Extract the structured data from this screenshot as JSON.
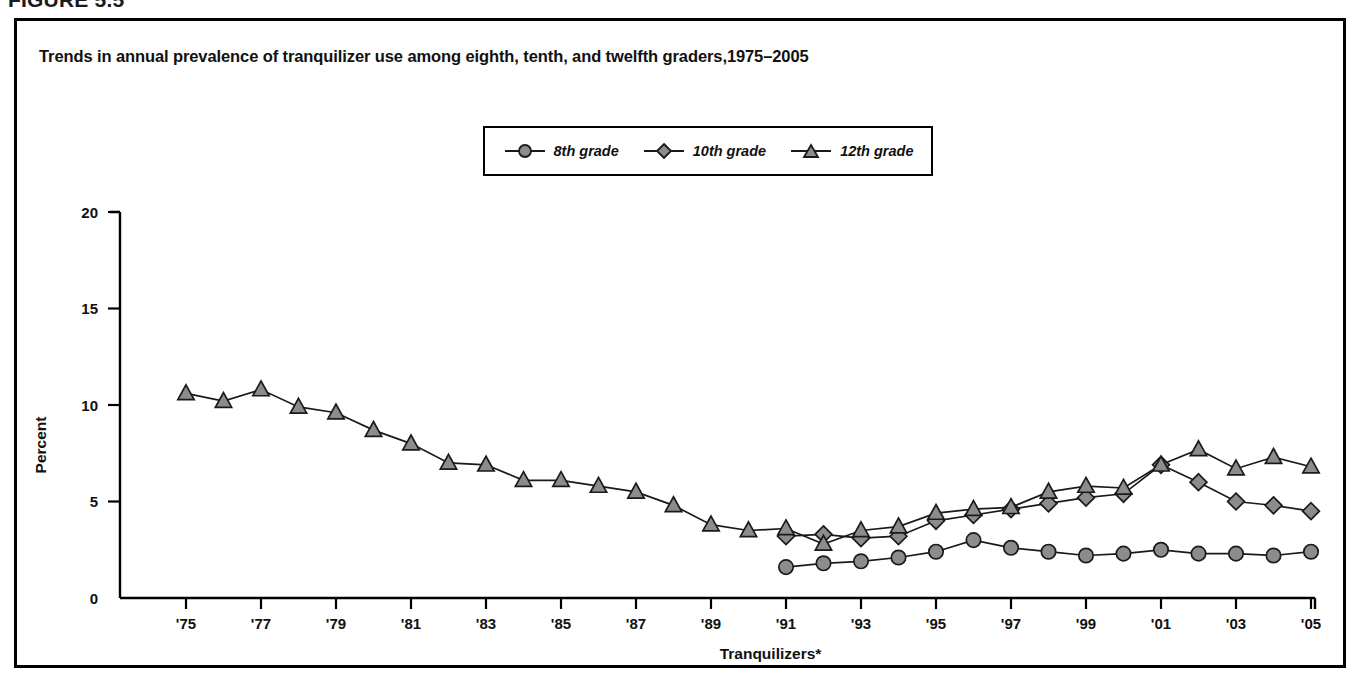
{
  "figure": {
    "number_label": "FIGURE 5.5",
    "title": "Trends in annual prevalence of tranquilizer use among eighth, tenth, and twelfth graders,1975–2005"
  },
  "legend": {
    "position": "top-center",
    "entries": [
      {
        "label": "8th grade",
        "marker": "circle",
        "marker_color": "#8c8c8c"
      },
      {
        "label": "10th grade",
        "marker": "diamond",
        "marker_color": "#8c8c8c"
      },
      {
        "label": "12th grade",
        "marker": "triangle",
        "marker_color": "#8c8c8c"
      }
    ]
  },
  "chart_data": {
    "type": "line",
    "title": "Trends in annual prevalence of tranquilizer use among eighth, tenth, and twelfth graders,1975–2005",
    "xlabel": "Tranquilizers*",
    "ylabel": "Percent",
    "ylim": [
      0,
      20
    ],
    "yticks": [
      0,
      5,
      10,
      15,
      20
    ],
    "ytick_labels": [
      "0",
      "5",
      "10",
      "15",
      "20"
    ],
    "xlim": [
      1975,
      2005
    ],
    "xticks": [
      1975,
      1977,
      1979,
      1981,
      1983,
      1985,
      1987,
      1989,
      1991,
      1993,
      1995,
      1997,
      1999,
      2001,
      2003,
      2005
    ],
    "xtick_labels": [
      "'75",
      "'77",
      "'79",
      "'81",
      "'83",
      "'85",
      "'87",
      "'89",
      "'91",
      "'93",
      "'95",
      "'97",
      "'99",
      "'01",
      "'03",
      "'05"
    ],
    "grid": false,
    "footnote_marker": "*",
    "series": [
      {
        "name": "8th grade",
        "marker": "circle",
        "x": [
          1991,
          1992,
          1993,
          1994,
          1995,
          1996,
          1997,
          1998,
          1999,
          2000,
          2001,
          2002,
          2003,
          2004,
          2005
        ],
        "values": [
          1.6,
          1.8,
          1.9,
          2.1,
          2.4,
          3.0,
          2.6,
          2.4,
          2.2,
          2.3,
          2.5,
          2.3,
          2.3,
          2.2,
          2.4
        ]
      },
      {
        "name": "10th grade",
        "marker": "diamond",
        "x": [
          1991,
          1992,
          1993,
          1994,
          1995,
          1996,
          1997,
          1998,
          1999,
          2000,
          2001,
          2002,
          2003,
          2004,
          2005
        ],
        "values": [
          3.2,
          3.3,
          3.1,
          3.2,
          4.0,
          4.3,
          4.6,
          4.9,
          5.2,
          5.4,
          6.9,
          6.0,
          5.0,
          4.8,
          4.5
        ]
      },
      {
        "name": "12th grade",
        "marker": "triangle",
        "x": [
          1975,
          1976,
          1977,
          1978,
          1979,
          1980,
          1981,
          1982,
          1983,
          1984,
          1985,
          1986,
          1987,
          1988,
          1989,
          1990,
          1991,
          1992,
          1993,
          1994,
          1995,
          1996,
          1997,
          1998,
          1999,
          2000,
          2001,
          2002,
          2003,
          2004,
          2005
        ],
        "values": [
          10.6,
          10.2,
          10.8,
          9.9,
          9.6,
          8.7,
          8.0,
          7.0,
          6.9,
          6.1,
          6.1,
          5.8,
          5.5,
          4.8,
          3.8,
          3.5,
          3.6,
          2.8,
          3.5,
          3.7,
          4.4,
          4.6,
          4.7,
          5.5,
          5.8,
          5.7,
          6.9,
          7.7,
          6.7,
          7.3,
          6.8
        ]
      }
    ]
  }
}
